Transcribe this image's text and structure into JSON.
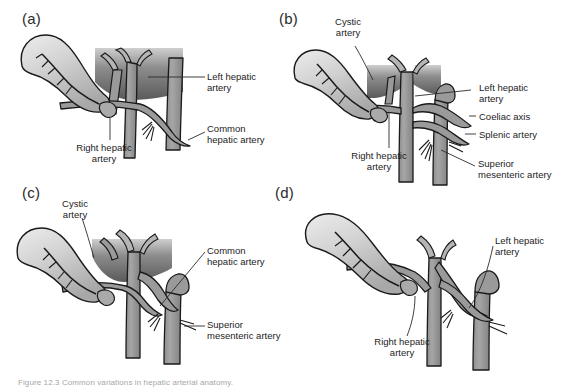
{
  "figure": {
    "caption": "Figure 12.3 Common variations in hepatic arterial anatomy.",
    "panels": [
      {
        "id": "a",
        "letter": "(a)",
        "labels": [
          {
            "key": "left_hepatic",
            "text": "Left hepatic\nartery"
          },
          {
            "key": "common_hepatic",
            "text": "Common\nhepatic artery"
          },
          {
            "key": "right_hepatic",
            "text": "Right hepatic\nartery"
          }
        ]
      },
      {
        "id": "b",
        "letter": "(b)",
        "labels": [
          {
            "key": "cystic",
            "text": "Cystic\nartery"
          },
          {
            "key": "left_hepatic",
            "text": "Left hepatic\nartery"
          },
          {
            "key": "coeliac_axis",
            "text": "Coeliac axis"
          },
          {
            "key": "splenic",
            "text": "Splenic artery"
          },
          {
            "key": "superior_mesenteric",
            "text": "Superior\nmesenteric artery"
          },
          {
            "key": "right_hepatic",
            "text": "Right hepatic\nartery"
          }
        ]
      },
      {
        "id": "c",
        "letter": "(c)",
        "labels": [
          {
            "key": "cystic",
            "text": "Cystic\nartery"
          },
          {
            "key": "common_hepatic",
            "text": "Common\nhepatic artery"
          },
          {
            "key": "superior_mesenteric",
            "text": "Superior\nmesenteric artery"
          }
        ]
      },
      {
        "id": "d",
        "letter": "(d)",
        "labels": [
          {
            "key": "left_hepatic",
            "text": "Left hepatic\nartery"
          },
          {
            "key": "right_hepatic",
            "text": "Right hepatic\nartery"
          }
        ]
      }
    ]
  },
  "colors": {
    "vessel_fill": "#9a9a9a",
    "vessel_stroke": "#1a1a1a",
    "gallbladder_light": "#e3e3e3",
    "gallbladder_dark": "#b0b0b0",
    "liver_dark": "#5d5d5d",
    "liver_light": "#cfcfcf",
    "label_text": "#1c1c1c",
    "leader_line": "#2b2b2b",
    "background": "#ffffff"
  }
}
